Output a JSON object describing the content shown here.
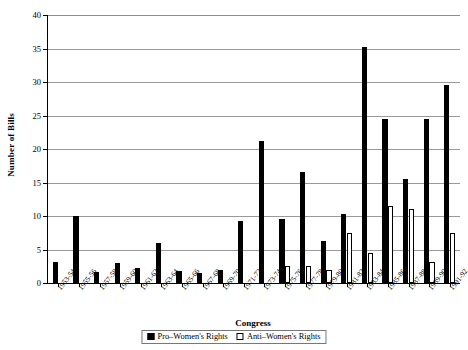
{
  "chart_data": {
    "type": "bar",
    "title": "",
    "xlabel": "Congress",
    "ylabel": "Number of Bills",
    "ylim": [
      0,
      40
    ],
    "ytick_step": 5,
    "yticks": [
      0,
      5,
      10,
      15,
      20,
      25,
      30,
      35,
      40
    ],
    "grid": true,
    "grid_axis": "y",
    "legend_position": "bottom-center",
    "categories": [
      "1953-54",
      "1955-56",
      "1957-58",
      "1959-60",
      "1961-62",
      "1963-64",
      "1965-66",
      "1967-68",
      "1969-70",
      "1971-72",
      "1973-74",
      "1975-76",
      "1977-78",
      "1979-80",
      "1981-82",
      "1983-84",
      "1985-86",
      "1987-88",
      "1989-90",
      "1991-92"
    ],
    "series": [
      {
        "name": "Pro-Women's Rights",
        "color": "#000000",
        "style": "filled",
        "values": [
          3.2,
          10,
          1.7,
          3,
          2.2,
          6,
          1.8,
          1.5,
          2,
          9.3,
          21.2,
          9.5,
          16.5,
          6.3,
          10.3,
          35.3,
          24.5,
          15.5,
          24.5,
          29.5
        ]
      },
      {
        "name": "Anti-Women's Rights",
        "color": "#ffffff",
        "style": "outline",
        "values": [
          0,
          0,
          0,
          0,
          0,
          0,
          0,
          0,
          0,
          0,
          0,
          2.5,
          2.5,
          2,
          7.5,
          4.5,
          11.5,
          11,
          3.2,
          7.5
        ]
      }
    ]
  },
  "legend": {
    "items": [
      {
        "label": "Pro–Women's Rights",
        "swatch": "filled-black"
      },
      {
        "label": "Anti–Women's Rights",
        "swatch": "outline-white"
      }
    ]
  },
  "axes": {
    "y_title": "Number of Bills",
    "x_title": "Congress"
  }
}
